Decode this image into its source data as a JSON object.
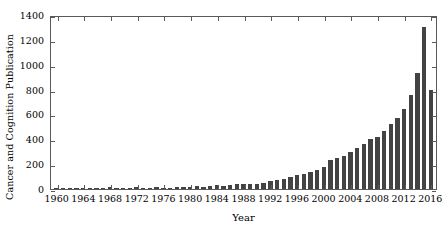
{
  "chart_data": {
    "type": "bar",
    "title": "",
    "xlabel": "Year",
    "ylabel": "Cancer and Cognition Publication",
    "xlim": [
      1959,
      2017
    ],
    "ylim": [
      0,
      1400
    ],
    "yticks": [
      0,
      200,
      400,
      600,
      800,
      1000,
      1200,
      1400
    ],
    "xticks": [
      1960,
      1964,
      1968,
      1972,
      1976,
      1980,
      1984,
      1988,
      1992,
      1996,
      2000,
      2004,
      2008,
      2012,
      2016
    ],
    "grid": false,
    "legend": null,
    "bar_color": "#434343",
    "axis_color": "#5a5a5a",
    "categories": [
      1960,
      1961,
      1962,
      1963,
      1964,
      1965,
      1966,
      1967,
      1968,
      1969,
      1970,
      1971,
      1972,
      1973,
      1974,
      1975,
      1976,
      1977,
      1978,
      1979,
      1980,
      1981,
      1982,
      1983,
      1984,
      1985,
      1986,
      1987,
      1988,
      1989,
      1990,
      1991,
      1992,
      1993,
      1994,
      1995,
      1996,
      1997,
      1998,
      1999,
      2000,
      2001,
      2002,
      2003,
      2004,
      2005,
      2006,
      2007,
      2008,
      2009,
      2010,
      2011,
      2012,
      2013,
      2014,
      2015,
      2016
    ],
    "values": [
      2,
      1,
      1,
      1,
      10,
      2,
      2,
      2,
      14,
      12,
      6,
      8,
      16,
      10,
      8,
      14,
      12,
      10,
      16,
      14,
      18,
      22,
      20,
      26,
      30,
      26,
      34,
      38,
      42,
      40,
      44,
      52,
      66,
      72,
      84,
      96,
      110,
      120,
      140,
      150,
      175,
      230,
      250,
      265,
      300,
      330,
      360,
      400,
      420,
      470,
      520,
      570,
      640,
      760,
      930,
      1300,
      800
    ]
  }
}
